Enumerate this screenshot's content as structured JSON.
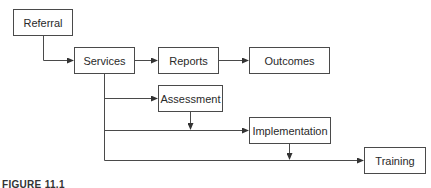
{
  "diagram": {
    "type": "flowchart",
    "nodes": {
      "referral": "Referral",
      "services": "Services",
      "reports": "Reports",
      "outcomes": "Outcomes",
      "assessment": "Assessment",
      "implementation": "Implementation",
      "training": "Training"
    },
    "edges": [
      {
        "from": "Referral",
        "to": "Services"
      },
      {
        "from": "Services",
        "to": "Reports"
      },
      {
        "from": "Reports",
        "to": "Outcomes"
      },
      {
        "from": "Services",
        "to": "Assessment"
      },
      {
        "from": "Services",
        "to": "Implementation"
      },
      {
        "from": "Assessment",
        "to": "Implementation"
      },
      {
        "from": "Services",
        "to": "Training"
      },
      {
        "from": "Implementation",
        "to": "Training"
      }
    ],
    "caption": "FIGURE 11.1",
    "line_color": "#4a4a4a"
  }
}
